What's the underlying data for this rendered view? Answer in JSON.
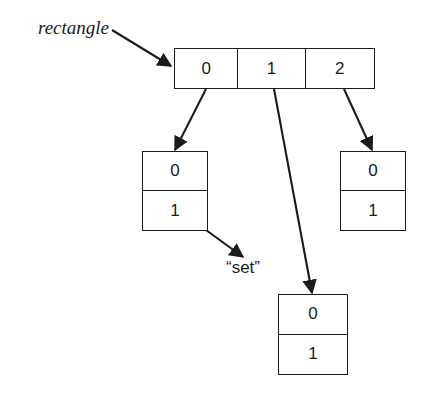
{
  "figure": {
    "background_color": "#ffffff",
    "stroke_color": "#1b1b1b",
    "width": 427,
    "height": 397
  },
  "labels": {
    "rectangle": "rectangle",
    "set": "“set”"
  },
  "nodes": {
    "array": {
      "name": "rectangle",
      "cells": [
        {
          "index": "0"
        },
        {
          "index": "1"
        },
        {
          "index": "2"
        }
      ]
    },
    "set_left": {
      "cells": [
        {
          "index": "0"
        },
        {
          "index": "1"
        }
      ]
    },
    "set_middle": {
      "cells": [
        {
          "index": "0"
        },
        {
          "index": "1"
        }
      ]
    },
    "set_right": {
      "cells": [
        {
          "index": "0"
        },
        {
          "index": "1"
        }
      ]
    }
  },
  "arrows": [
    {
      "name": "rectangle-label-arrow",
      "from": "rectangle label",
      "to": "array cell 0"
    },
    {
      "name": "array-0-arrow",
      "from": "array cell 0",
      "to": "left set box"
    },
    {
      "name": "array-1-arrow",
      "from": "array cell 1",
      "to": "middle set box"
    },
    {
      "name": "array-2-arrow",
      "from": "array cell 2",
      "to": "right set box"
    },
    {
      "name": "set-label-arrow",
      "from": "left set box",
      "to": "set label"
    }
  ]
}
